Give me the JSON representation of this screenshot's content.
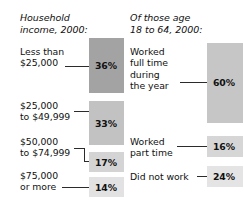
{
  "chart_data": {
    "type": "bar",
    "title": "",
    "panels": [
      {
        "title": "Household\nincome, 2000:",
        "categories": [
          "Less than\n$25,000",
          "$25,000\nto $49,999",
          "$50,000\nto $74,999",
          "$75,000\nor more"
        ],
        "values": [
          36,
          33,
          17,
          14
        ],
        "value_labels": [
          "36%",
          "33%",
          "17%",
          "14%"
        ],
        "bar_colors": [
          "#a3a3a3",
          "#c2c2c2",
          "#d4d4d4",
          "#e2e2e2"
        ]
      },
      {
        "title": "Of those age\n18 to 64, 2000:",
        "categories": [
          "Worked\nfull time\nduring\nthe year",
          "Worked\npart time",
          "Did not work"
        ],
        "values": [
          60,
          16,
          24
        ],
        "value_labels": [
          "60%",
          "16%",
          "24%"
        ],
        "bar_colors": [
          "#c6c6c6",
          "#d6d6d6",
          "#e4e4e4"
        ]
      }
    ],
    "xlabel": "",
    "ylabel": "",
    "grid": false,
    "legend": "none",
    "units": "percent"
  }
}
